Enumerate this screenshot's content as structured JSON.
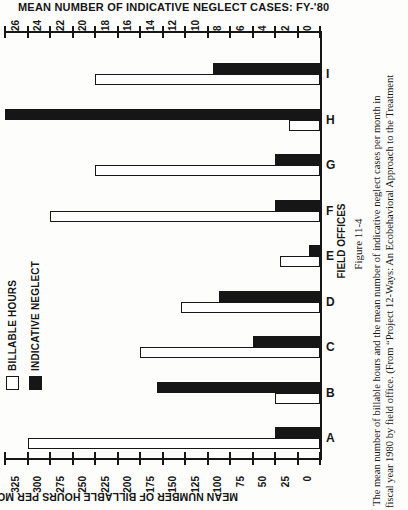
{
  "page": {
    "background": "#fdfdfb",
    "ink": "#161616"
  },
  "top_axis_title": "MEAN NUMBER OF INDICATIVE NEGLECT CASES:  FY-'80",
  "bottom_axis_title": "MEAN NUMBER OF BILLABLE HOURS PER MONTH : FY-'80",
  "category_axis_title": "FIELD OFFICES",
  "legend": {
    "items": [
      {
        "label": "BILLABLE HOURS",
        "swatch": "white"
      },
      {
        "label": "INDICATIVE NEGLECT",
        "swatch": "black"
      }
    ]
  },
  "caption": {
    "figure_label": "Figure 11-4",
    "lines": [
      "The mean number of billable hours and the mean number of indicative neglect cases per month in",
      "fiscal year 1980 by field office. (From “Project 12-Ways: An Ecobehavioral Approach to the Treatment"
    ]
  },
  "chart_data": {
    "type": "bar",
    "title": "MEAN NUMBER OF INDICATIVE NEGLECT CASES:  FY-'80",
    "note": "Figure printed rotated 90deg CCW on the book page; paired horizontal bars extend leftward from a shared zero baseline. Offices listed A (bottom) to I (top).",
    "categories": [
      "A",
      "B",
      "C",
      "D",
      "E",
      "F",
      "G",
      "H",
      "I"
    ],
    "display_order_top_to_bottom": [
      "I",
      "H",
      "G",
      "F",
      "E",
      "D",
      "C",
      "B",
      "A"
    ],
    "series": [
      {
        "name": "BILLABLE HOURS",
        "fill": "white",
        "axis_title": "MEAN NUMBER OF BILLABLE HOURS PER MONTH : FY-'80",
        "axis_min": 0,
        "axis_max": 350,
        "tick_step": 25,
        "values": [
          325,
          50,
          200,
          155,
          45,
          300,
          250,
          35,
          250
        ]
      },
      {
        "name": "INDICATIVE NEGLECT",
        "fill": "black",
        "axis_title": "MEAN NUMBER OF INDICATIVE NEGLECT CASES:  FY-'80",
        "axis_min": 0,
        "axis_max": 28,
        "tick_step": 2,
        "values": [
          4,
          14.5,
          6,
          9,
          1,
          4,
          4,
          28,
          9.5
        ]
      }
    ],
    "grid": false,
    "legend_position": "lower-left of rotated figure"
  }
}
